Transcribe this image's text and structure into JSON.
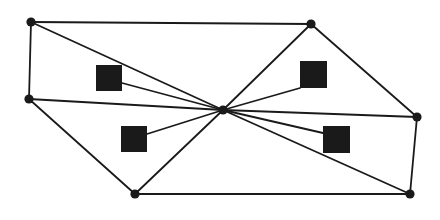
{
  "figure": {
    "type": "node-link-diagram",
    "title": "",
    "background_color": "#ffffff",
    "stroke_color": "#1a1a1a",
    "node_fill_color": "#1a1a1a",
    "square_fill_color": "#1a1a1a",
    "width": 440,
    "height": 220,
    "edge_stroke_width": 1.8,
    "node_radius": 4.6,
    "square_size": 26
  },
  "nodes": [
    {
      "id": "n-top-left",
      "label": "top-left vertex",
      "x": 31,
      "y": 22,
      "shape": "dot"
    },
    {
      "id": "n-top-right",
      "label": "top-right vertex",
      "x": 311,
      "y": 24,
      "shape": "dot"
    },
    {
      "id": "n-left-mid",
      "label": "left-middle vertex",
      "x": 29,
      "y": 99,
      "shape": "dot"
    },
    {
      "id": "n-right-mid",
      "label": "right-middle vertex",
      "x": 417,
      "y": 117,
      "shape": "dot"
    },
    {
      "id": "n-bottom-left",
      "label": "bottom-left vertex",
      "x": 135,
      "y": 194,
      "shape": "dot"
    },
    {
      "id": "n-bottom-right",
      "label": "bottom-right vertex",
      "x": 410,
      "y": 194,
      "shape": "dot"
    },
    {
      "id": "n-center",
      "label": "center hub",
      "x": 223,
      "y": 110,
      "shape": "dot"
    }
  ],
  "squares": [
    {
      "id": "sq-top-left",
      "label": "upper-left block",
      "x": 96,
      "y": 65,
      "size": 26,
      "anchor_x": 122,
      "anchor_y": 83
    },
    {
      "id": "sq-top-right",
      "label": "upper-right block",
      "x": 300,
      "y": 61,
      "size": 27,
      "anchor_x": 300,
      "anchor_y": 88
    },
    {
      "id": "sq-bottom-left",
      "label": "lower-left block",
      "x": 121,
      "y": 126,
      "size": 26,
      "anchor_x": 147,
      "anchor_y": 134
    },
    {
      "id": "sq-bottom-right",
      "label": "lower-right block",
      "x": 323,
      "y": 126,
      "size": 27,
      "anchor_x": 323,
      "anchor_y": 133
    }
  ],
  "edges": [
    {
      "id": "e-outer-top",
      "from": "n-top-left",
      "to": "n-top-right",
      "kind": "outer-boundary"
    },
    {
      "id": "e-outer-left-upper",
      "from": "n-top-left",
      "to": "n-left-mid",
      "kind": "outer-boundary"
    },
    {
      "id": "e-outer-left-lower",
      "from": "n-left-mid",
      "to": "n-bottom-left",
      "kind": "outer-boundary"
    },
    {
      "id": "e-outer-bottom",
      "from": "n-bottom-left",
      "to": "n-bottom-right",
      "kind": "outer-boundary"
    },
    {
      "id": "e-outer-right-lower",
      "from": "n-bottom-right",
      "to": "n-right-mid",
      "kind": "outer-boundary"
    },
    {
      "id": "e-outer-right-upper",
      "from": "n-right-mid",
      "to": "n-top-right",
      "kind": "outer-boundary"
    },
    {
      "id": "e-hub-top-left",
      "from": "n-center",
      "to": "n-top-left",
      "kind": "spoke"
    },
    {
      "id": "e-hub-top-right",
      "from": "n-center",
      "to": "n-top-right",
      "kind": "spoke"
    },
    {
      "id": "e-hub-left-mid",
      "from": "n-center",
      "to": "n-left-mid",
      "kind": "spoke"
    },
    {
      "id": "e-hub-right-mid",
      "from": "n-center",
      "to": "n-right-mid",
      "kind": "spoke"
    },
    {
      "id": "e-hub-bottom-left",
      "from": "n-center",
      "to": "n-bottom-left",
      "kind": "spoke"
    },
    {
      "id": "e-hub-bottom-right",
      "from": "n-center",
      "to": "n-bottom-right",
      "kind": "spoke"
    },
    {
      "id": "e-hub-sq-top-left",
      "from": "n-center",
      "to": "sq-top-left",
      "kind": "block-spoke"
    },
    {
      "id": "e-hub-sq-top-right",
      "from": "n-center",
      "to": "sq-top-right",
      "kind": "block-spoke"
    },
    {
      "id": "e-hub-sq-bottom-left",
      "from": "n-center",
      "to": "sq-bottom-left",
      "kind": "block-spoke"
    },
    {
      "id": "e-hub-sq-bottom-right",
      "from": "n-center",
      "to": "sq-bottom-right",
      "kind": "block-spoke"
    }
  ],
  "chart_data": {
    "type": "scatter",
    "title": "",
    "xlabel": "",
    "ylabel": "",
    "grid": false,
    "legend": "none",
    "xlim": [
      0,
      440
    ],
    "ylim": [
      0,
      220
    ],
    "series": [
      {
        "name": "vertices",
        "marker": "filled-circle",
        "x": [
          31,
          311,
          29,
          417,
          135,
          410,
          223
        ],
        "y": [
          22,
          24,
          99,
          117,
          194,
          194,
          110
        ]
      },
      {
        "name": "blocks",
        "marker": "filled-square",
        "x": [
          109,
          313.5,
          134,
          336.5
        ],
        "y": [
          78,
          74.5,
          139,
          139.5
        ]
      }
    ]
  }
}
